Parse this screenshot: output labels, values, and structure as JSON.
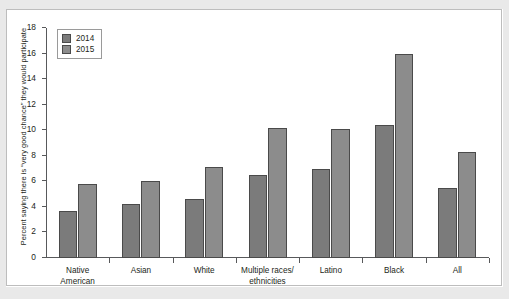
{
  "chart_data": {
    "type": "bar",
    "title": "",
    "xlabel": "",
    "ylabel": "Percent saying there is “very good chance” they would participate",
    "categories": [
      "Native\nAmerican",
      "Asian",
      "White",
      "Multiple races/\nethnicities",
      "Latino",
      "Black",
      "All"
    ],
    "category_lines": [
      [
        "Native",
        "American"
      ],
      [
        "Asian"
      ],
      [
        "White"
      ],
      [
        "Multiple races/",
        "ethnicities"
      ],
      [
        "Latino"
      ],
      [
        "Black"
      ],
      [
        "All"
      ]
    ],
    "series": [
      {
        "name": "2014",
        "color": "#7b7b7b",
        "values": [
          3.7,
          4.2,
          4.6,
          6.5,
          7.0,
          10.4,
          5.5
        ]
      },
      {
        "name": "2015",
        "color": "#8c8c8c",
        "values": [
          5.8,
          6.0,
          7.1,
          10.2,
          10.1,
          16.0,
          8.3
        ]
      }
    ],
    "ylim": [
      0,
      18
    ],
    "ytick_labels": [
      "0",
      "2",
      "4",
      "6",
      "8",
      "10",
      "12",
      "14",
      "16",
      "18"
    ],
    "ytick_values": [
      0,
      2,
      4,
      6,
      8,
      10,
      12,
      14,
      16,
      18
    ],
    "grid": false,
    "legend_position": "upper-left",
    "legend_entries": [
      "2014",
      "2015"
    ]
  }
}
